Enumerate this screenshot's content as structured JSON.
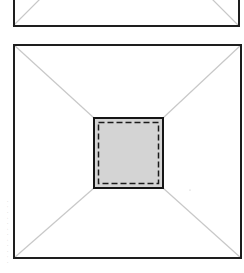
{
  "diagram": {
    "colors": {
      "background": "#ffffff",
      "frame_stroke": "#1e1e1e",
      "diagonal_stroke": "#c8c8c8",
      "inner_fill": "#d4d4d4",
      "inner_stroke": "#151515",
      "dash_stroke": "#1a1a1a",
      "caption": "#9a9a9a"
    },
    "top_panel": {
      "x": 13,
      "y": -40,
      "width": 226,
      "height": 66,
      "stroke_width": 2
    },
    "main_panel": {
      "x": 13,
      "y": 44,
      "width": 229,
      "height": 215,
      "stroke_width": 2
    },
    "inner_square": {
      "x": 94,
      "y": 118,
      "width": 69,
      "height": 70,
      "stroke_width": 2,
      "dashed_inset": 4,
      "dash_pattern": "6 3"
    },
    "side_caption": {
      "text": "· · ·  · · · · ·  · · · ·"
    }
  }
}
